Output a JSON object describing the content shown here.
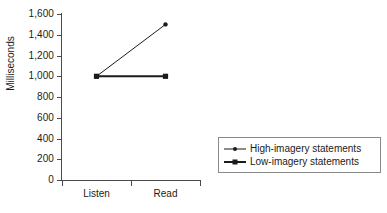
{
  "chart_data": {
    "type": "line",
    "title": "",
    "xlabel": "",
    "ylabel": "Milliseconds",
    "categories": [
      "Listen",
      "Read"
    ],
    "series": [
      {
        "name": "High-imagery statements",
        "values": [
          1000,
          1500
        ],
        "marker": "circle",
        "line_width": "thin",
        "color": "#1b1b1b"
      },
      {
        "name": "Low-imagery statements",
        "values": [
          1000,
          1000
        ],
        "marker": "square",
        "line_width": "thick",
        "color": "#1b1b1b"
      }
    ],
    "ylim": [
      0,
      1600
    ],
    "ytick_step": 200,
    "ytick_labels": [
      "1,600",
      "1,400",
      "1,200",
      "1,000",
      "800",
      "600",
      "400",
      "200",
      "0"
    ],
    "ytick_values": [
      1600,
      1400,
      1200,
      1000,
      800,
      600,
      400,
      200,
      0
    ],
    "grid": false,
    "legend_position": "right",
    "background_color": "#ffffff",
    "axis_color": "#4a4a4a",
    "text_color": "#1b1b1b"
  },
  "legend": {
    "entries": [
      {
        "label": "High-imagery statements"
      },
      {
        "label": "Low-imagery statements"
      }
    ]
  }
}
